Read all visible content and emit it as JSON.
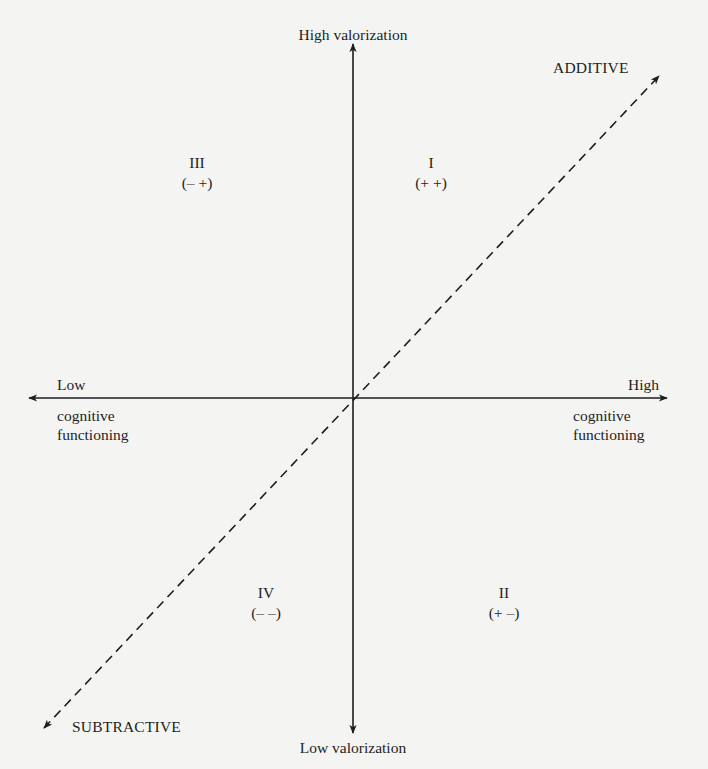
{
  "diagram": {
    "axes": {
      "vertical": {
        "top_label": "High valorization",
        "bottom_label": "Low valorization"
      },
      "horizontal": {
        "left_label_line1": "Low",
        "left_label_line2": "cognitive",
        "left_label_line3": "functioning",
        "right_label_line1": "High",
        "right_label_line2": "cognitive",
        "right_label_line3": "functioning"
      },
      "diagonal": {
        "upper_label": "ADDITIVE",
        "lower_label": "SUBTRACTIVE",
        "style": "dashed"
      }
    },
    "quadrants": [
      {
        "numeral": "I",
        "signs": "(+ +)",
        "position": "upper-right"
      },
      {
        "numeral": "II",
        "signs": "(+ –)",
        "position": "lower-right"
      },
      {
        "numeral": "III",
        "signs": "(– +)",
        "position": "upper-left"
      },
      {
        "numeral": "IV",
        "signs": "(– –)",
        "position": "lower-left"
      }
    ],
    "colors": {
      "background": "#f4f4f2",
      "ink": "#1e1e1e"
    }
  }
}
